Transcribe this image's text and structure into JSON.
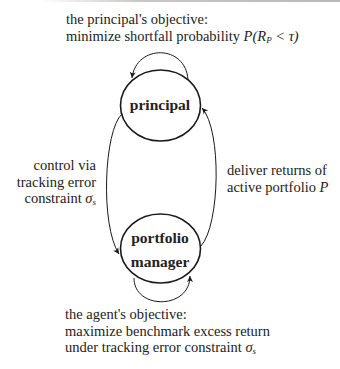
{
  "diagram": {
    "nodes": {
      "principal": {
        "label": "principal"
      },
      "portfolio_manager": {
        "line1": "portfolio",
        "line2": "manager"
      }
    },
    "principal_objective": {
      "line1": "the principal's objective:",
      "line2_text": "minimize shortfall probability ",
      "line2_math": "P(R",
      "line2_sub": "P",
      "line2_math_end": " < τ)"
    },
    "edge_control": {
      "line1": "control via",
      "line2": "tracking error",
      "line3_text": "constraint ",
      "line3_math": "σ",
      "line3_sub": "s"
    },
    "edge_deliver": {
      "line1": "deliver returns of",
      "line2_text": "active portfolio ",
      "line2_math": "P"
    },
    "agent_objective": {
      "line1": "the agent's objective:",
      "line2": "maximize benchmark excess return",
      "line3_text": "under tracking error constraint ",
      "line3_math": "σ",
      "line3_sub": "s"
    },
    "colors": {
      "stroke": "#1a1a1a",
      "text": "#222222",
      "background": "#ffffff"
    }
  }
}
